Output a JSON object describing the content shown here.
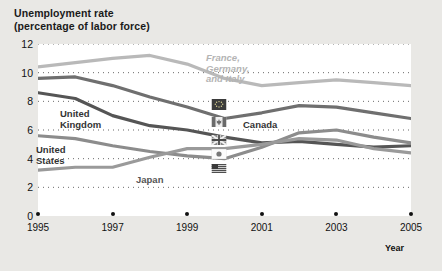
{
  "figure": {
    "title": "Unemployment rate\n(percentage of labor force)",
    "background_color": "#e9e8e5",
    "plot_background_color": "#ffffff"
  },
  "axis": {
    "x_axis_label": "Year",
    "y_ticks": [
      "0",
      "2",
      "4",
      "6",
      "8",
      "10",
      "12"
    ],
    "x_ticks": [
      "1995",
      "1997",
      "1999",
      "2001",
      "2003",
      "2005"
    ]
  },
  "series_labels": {
    "fgi": "France,\nGermany,\nand Italy",
    "canada": "Canada",
    "uk": "United\nKingdom",
    "us": "United\nStates",
    "japan": "Japan"
  },
  "icons": {
    "fgi": "eu-flag-icon",
    "canada": "canada-flag-icon",
    "uk": "uk-flag-icon",
    "us": "us-flag-icon",
    "japan": "japan-flag-icon"
  },
  "chart_data": {
    "type": "line",
    "title": "Unemployment rate (percentage of labor force)",
    "xlabel": "Year",
    "ylabel": "Unemployment rate (percentage of labor force)",
    "xlim": [
      1995,
      2005
    ],
    "ylim": [
      0,
      12
    ],
    "y_ticks": [
      0,
      2,
      4,
      6,
      8,
      10,
      12
    ],
    "x_ticks": [
      1995,
      1997,
      1999,
      2001,
      2003,
      2005
    ],
    "grid": "horizontal-dotted",
    "legend": "inline-labels",
    "x": [
      1995,
      1996,
      1997,
      1998,
      1999,
      2000,
      2001,
      2002,
      2003,
      2004,
      2005
    ],
    "series": [
      {
        "name": "France, Germany, and Italy",
        "color": "#b9b9b9",
        "values": [
          10.4,
          10.7,
          11.0,
          11.2,
          10.6,
          9.6,
          9.1,
          9.3,
          9.5,
          9.3,
          9.1
        ]
      },
      {
        "name": "Canada",
        "color": "#6f6f6f",
        "values": [
          9.6,
          9.7,
          9.1,
          8.3,
          7.6,
          6.8,
          7.2,
          7.7,
          7.6,
          7.2,
          6.8
        ]
      },
      {
        "name": "United Kingdom",
        "color": "#555555",
        "values": [
          8.6,
          8.2,
          7.0,
          6.3,
          6.0,
          5.5,
          5.1,
          5.2,
          5.0,
          4.8,
          4.9
        ]
      },
      {
        "name": "United States",
        "color": "#8c8c8c",
        "values": [
          5.6,
          5.4,
          4.9,
          4.5,
          4.2,
          4.0,
          4.8,
          5.8,
          6.0,
          5.5,
          5.1
        ]
      },
      {
        "name": "Japan",
        "color": "#9a9a9a",
        "values": [
          3.2,
          3.4,
          3.4,
          4.1,
          4.7,
          4.7,
          5.0,
          5.4,
          5.3,
          4.7,
          4.4
        ]
      }
    ]
  }
}
